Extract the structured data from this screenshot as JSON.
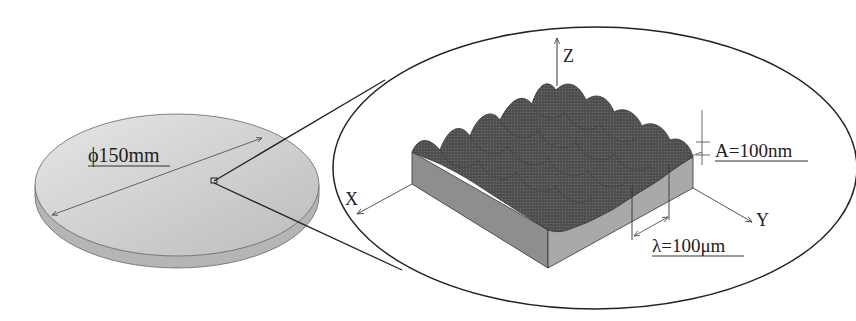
{
  "wafer": {
    "diameter_label": "ϕ150mm",
    "colors": {
      "top": "#cfcfcf",
      "edge": "#bdbdbd",
      "outline": "#555555"
    }
  },
  "zoom_view": {
    "axes": {
      "x_label": "X",
      "y_label": "Y",
      "z_label": "Z"
    },
    "amplitude_label": "A=100nm",
    "wavelength_label": "λ=100μm",
    "colors": {
      "surface": "#5a5a5a",
      "side_left": "#8c8c8c",
      "side_right": "#a8a8a8",
      "outline": "#222222"
    }
  }
}
